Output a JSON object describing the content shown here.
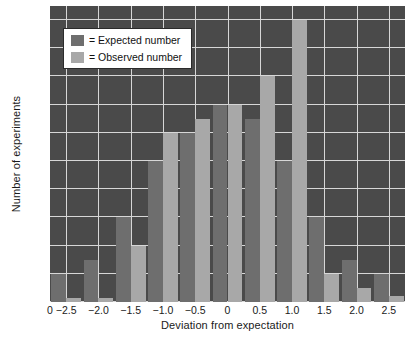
{
  "chart_data": {
    "type": "bar",
    "title": "",
    "xlabel": "Deviation from expectation",
    "ylabel": "Number of experiments",
    "xlim": [
      -2.75,
      2.75
    ],
    "ylim": [
      0,
      21
    ],
    "grid": true,
    "legend_position": "top-left",
    "plot_background": "#4a4a4a",
    "grid_color": "#d7d7d7",
    "origin_label": "0",
    "xticks": [
      -2.5,
      -2.0,
      -1.5,
      -1.0,
      -0.5,
      0,
      0.5,
      1.0,
      1.5,
      2.0,
      2.5
    ],
    "xticklabels": [
      "−2.5",
      "−2.0",
      "−1.5",
      "−1.0",
      "−0.5",
      "0",
      "0.5",
      "1.0",
      "1.5",
      "2.0",
      "2.5"
    ],
    "yticks": [
      0,
      2,
      4,
      6,
      8,
      10,
      12,
      14,
      16,
      18,
      20
    ],
    "yticklabels": [
      "0",
      "2",
      "4",
      "6",
      "8",
      "10",
      "12",
      "14",
      "16",
      "18",
      "20"
    ],
    "bin_centers": [
      -2.5,
      -2.0,
      -1.5,
      -1.0,
      -0.5,
      0,
      0.5,
      1.0,
      1.5,
      2.0,
      2.5
    ],
    "bar_width": 0.23,
    "series": [
      {
        "name": "Expected number",
        "color": "#6e6e6e",
        "values": [
          2,
          3,
          6,
          10,
          12,
          14,
          13,
          10,
          6,
          3,
          2
        ]
      },
      {
        "name": "Observed number",
        "color": "#a8a8a8",
        "values": [
          0.3,
          0.3,
          4,
          12,
          13,
          14,
          16,
          20,
          2,
          1,
          0.4
        ]
      }
    ],
    "legend": [
      {
        "marker": "expected-swatch",
        "prefix": "=",
        "label": "Expected number"
      },
      {
        "marker": "observed-swatch",
        "prefix": "=",
        "label": "Observed number"
      }
    ]
  }
}
